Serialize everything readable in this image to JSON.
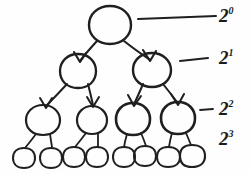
{
  "diagram": {
    "type": "hand-drawn-binary-tree",
    "stroke_color": "#1f1f1f",
    "background_color": "#fefefe",
    "levels": 4,
    "nodes_per_level": [
      1,
      2,
      4,
      8
    ],
    "edges_have_arrowheads": true,
    "arrow_direction": "parent-to-child",
    "labels": [
      {
        "base": "2",
        "exponent": "0",
        "text": "2^0",
        "level": 0,
        "has_connector": true,
        "connector_length": "long"
      },
      {
        "base": "2",
        "exponent": "1",
        "text": "2^1",
        "level": 1,
        "has_connector": true,
        "connector_length": "medium"
      },
      {
        "base": "2",
        "exponent": "2",
        "text": "2^2",
        "level": 2,
        "has_connector": true,
        "connector_length": "short"
      },
      {
        "base": "2",
        "exponent": "3",
        "text": "2^3",
        "level": 3,
        "has_connector": false,
        "connector_length": "none"
      }
    ],
    "node_geometry": {
      "level_0": [
        {
          "cx": 110,
          "cy": 25,
          "rx": 21,
          "ry": 19
        }
      ],
      "level_1": [
        {
          "cx": 78,
          "cy": 71,
          "rx": 18,
          "ry": 17
        },
        {
          "cx": 152,
          "cy": 70,
          "rx": 19,
          "ry": 17
        }
      ],
      "level_2": [
        {
          "cx": 43,
          "cy": 120,
          "rx": 17,
          "ry": 15
        },
        {
          "cx": 92,
          "cy": 120,
          "rx": 15,
          "ry": 14
        },
        {
          "cx": 133,
          "cy": 119,
          "rx": 17,
          "ry": 16
        },
        {
          "cx": 178,
          "cy": 118,
          "rx": 17,
          "ry": 16
        }
      ],
      "level_3": [
        {
          "cx": 24,
          "cy": 158,
          "rx": 11,
          "ry": 10
        },
        {
          "cx": 51,
          "cy": 158,
          "rx": 11,
          "ry": 10
        },
        {
          "cx": 74,
          "cy": 157,
          "rx": 10,
          "ry": 10
        },
        {
          "cx": 97,
          "cy": 157,
          "rx": 11,
          "ry": 10
        },
        {
          "cx": 124,
          "cy": 157,
          "rx": 10,
          "ry": 10
        },
        {
          "cx": 145,
          "cy": 156,
          "rx": 10,
          "ry": 10
        },
        {
          "cx": 168,
          "cy": 157,
          "rx": 11,
          "ry": 10
        },
        {
          "cx": 192,
          "cy": 156,
          "rx": 12,
          "ry": 11
        }
      ]
    },
    "connectors": [
      {
        "x1": 138,
        "y1": 19,
        "x2": 216,
        "y2": 16
      },
      {
        "x1": 180,
        "y1": 61,
        "x2": 208,
        "y2": 58
      },
      {
        "x1": 200,
        "y1": 110,
        "x2": 213,
        "y2": 109
      }
    ]
  }
}
